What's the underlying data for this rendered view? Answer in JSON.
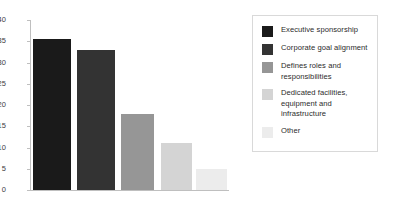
{
  "chart_data": {
    "type": "bar",
    "title": "",
    "subtitle": "",
    "xlabel": "",
    "ylabel": "",
    "ylim": [
      0,
      40
    ],
    "yticks": [
      "0",
      "5",
      "10",
      "15",
      "20",
      "25",
      "30",
      "35",
      "40"
    ],
    "grid": false,
    "legend_position": "right",
    "categories": [
      "Executive sponsorship",
      "Corporate goal alignment",
      "Defines roles and responsibilities",
      "Dedicated facilities, equipment and infrastructure",
      "Other"
    ],
    "values": [
      35.5,
      33,
      18,
      11,
      5
    ],
    "colors": [
      "#1a1a1a",
      "#333333",
      "#969696",
      "#d4d4d4",
      "#ececec"
    ],
    "series": [
      {
        "name": "",
        "values": [
          35.5,
          33,
          18,
          11,
          5
        ]
      }
    ]
  },
  "axis": {
    "ticks": [
      {
        "label": "40",
        "value": 40
      },
      {
        "label": "35",
        "value": 35
      },
      {
        "label": "30",
        "value": 30
      },
      {
        "label": "25",
        "value": 25
      },
      {
        "label": "20",
        "value": 20
      },
      {
        "label": "15",
        "value": 15
      },
      {
        "label": "10",
        "value": 10
      },
      {
        "label": "5",
        "value": 5
      },
      {
        "label": "0",
        "value": 0
      }
    ]
  },
  "legend": {
    "items": [
      {
        "label": "Executive sponsorship",
        "color": "#1a1a1a"
      },
      {
        "label": "Corporate goal alignment",
        "color": "#333333"
      },
      {
        "label": "Defines roles and responsibilities",
        "color": "#969696"
      },
      {
        "label": "Dedicated facilities, equipment and infrastructure",
        "color": "#d4d4d4"
      },
      {
        "label": "Other",
        "color": "#ececec"
      }
    ]
  }
}
